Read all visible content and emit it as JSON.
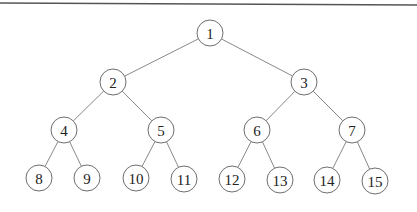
{
  "diagram": {
    "type": "complete-binary-tree",
    "colors": {
      "node_stroke": "#6f6f6f",
      "edge": "#7a7a7a",
      "text": "#222222",
      "rule": "#555555",
      "background": "#ffffff"
    },
    "node_radius": 13,
    "top_rule": {
      "x1": 0,
      "y1": 3,
      "x2": 417,
      "y2": 5
    },
    "nodes": [
      {
        "id": 1,
        "label": "1",
        "x": 210,
        "y": 33
      },
      {
        "id": 2,
        "label": "2",
        "x": 113,
        "y": 82
      },
      {
        "id": 3,
        "label": "3",
        "x": 304,
        "y": 82
      },
      {
        "id": 4,
        "label": "4",
        "x": 64,
        "y": 130
      },
      {
        "id": 5,
        "label": "5",
        "x": 161,
        "y": 130
      },
      {
        "id": 6,
        "label": "6",
        "x": 257,
        "y": 130
      },
      {
        "id": 7,
        "label": "7",
        "x": 352,
        "y": 130
      },
      {
        "id": 8,
        "label": "8",
        "x": 39,
        "y": 178
      },
      {
        "id": 9,
        "label": "9",
        "x": 87,
        "y": 178
      },
      {
        "id": 10,
        "label": "10",
        "x": 136,
        "y": 178
      },
      {
        "id": 11,
        "label": "11",
        "x": 184,
        "y": 179
      },
      {
        "id": 12,
        "label": "12",
        "x": 232,
        "y": 179
      },
      {
        "id": 13,
        "label": "13",
        "x": 280,
        "y": 180
      },
      {
        "id": 14,
        "label": "14",
        "x": 327,
        "y": 180
      },
      {
        "id": 15,
        "label": "15",
        "x": 375,
        "y": 181
      }
    ],
    "edges": [
      [
        1,
        2
      ],
      [
        1,
        3
      ],
      [
        2,
        4
      ],
      [
        2,
        5
      ],
      [
        3,
        6
      ],
      [
        3,
        7
      ],
      [
        4,
        8
      ],
      [
        4,
        9
      ],
      [
        5,
        10
      ],
      [
        5,
        11
      ],
      [
        6,
        12
      ],
      [
        6,
        13
      ],
      [
        7,
        14
      ],
      [
        7,
        15
      ]
    ]
  }
}
